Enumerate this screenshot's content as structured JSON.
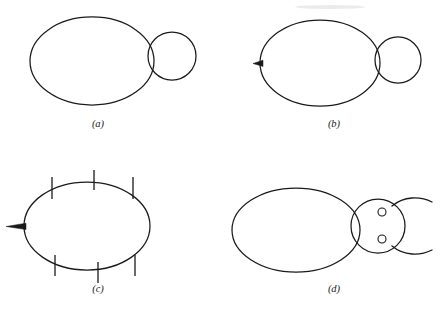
{
  "figure": {
    "type": "line-drawing-diagram",
    "background_color": "#ffffff",
    "stroke_color": "#1a1a1a",
    "width": 440,
    "height": 315
  },
  "panels": [
    {
      "id": "a",
      "label": "(a)",
      "label_x": 98,
      "label_y": 127,
      "parts": [
        "body-ellipse",
        "head-circle"
      ],
      "body": {
        "cx": 92,
        "cy": 61,
        "rx": 62,
        "ry": 44
      },
      "head": {
        "cx": 172,
        "cy": 56,
        "r": 24
      }
    },
    {
      "id": "b",
      "label": "(b)",
      "label_x": 334,
      "label_y": 127,
      "parts": [
        "body-ellipse",
        "head-circle",
        "tail-spike"
      ],
      "body": {
        "cx": 320,
        "cy": 63,
        "rx": 60,
        "ry": 43
      },
      "head": {
        "cx": 398,
        "cy": 60,
        "r": 23
      },
      "tail": {
        "tip_x": 253,
        "base_x": 262,
        "y": 63,
        "half_height": 3
      }
    },
    {
      "id": "c",
      "label": "(c)",
      "label_x": 98,
      "label_y": 292,
      "parts": [
        "body-ellipse",
        "tail-spike",
        "legs"
      ],
      "body": {
        "cx": 87,
        "cy": 226,
        "rx": 63,
        "ry": 44
      },
      "tail": {
        "tip_x": 6,
        "base_x": 25,
        "y": 226,
        "half_height": 3
      },
      "legs_top": 3,
      "legs_bottom": 3
    },
    {
      "id": "d",
      "label": "(d)",
      "label_x": 334,
      "label_y": 292,
      "parts": [
        "body-ellipse",
        "head-circle",
        "eyes",
        "antennae"
      ],
      "body": {
        "cx": 296,
        "cy": 230,
        "rx": 64,
        "ry": 42
      },
      "head": {
        "cx": 378,
        "cy": 226,
        "r": 27
      },
      "eyes": [
        {
          "cx": 382,
          "cy": 212,
          "r": 4
        },
        {
          "cx": 382,
          "cy": 239,
          "r": 4
        }
      ],
      "antennae": 2
    }
  ],
  "labels": {
    "a": "(a)",
    "b": "(b)",
    "c": "(c)",
    "d": "(d)"
  }
}
